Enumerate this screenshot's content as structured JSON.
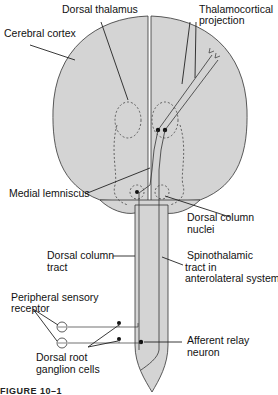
{
  "figure": {
    "caption": "FIGURE 10–1",
    "colors": {
      "tissue_fill": "#d4d4d4",
      "outline": "#333333",
      "background": "#ffffff"
    },
    "labels": {
      "dorsal_thalamus": "Dorsal thalamus",
      "thalamocortical_1": "Thalamocortical",
      "thalamocortical_2": "projection",
      "cerebral_cortex": "Cerebral cortex",
      "medial_lemniscus": "Medial lemniscus",
      "dorsal_column_nuclei_1": "Dorsal column",
      "dorsal_column_nuclei_2": "nuclei",
      "dorsal_column_tract_1": "Dorsal column",
      "dorsal_column_tract_2": "tract",
      "spinothalamic_1": "Spinothalamic",
      "spinothalamic_2": "tract in",
      "spinothalamic_3": "anterolateral system",
      "peripheral_receptor_1": "Peripheral sensory",
      "peripheral_receptor_2": "receptor",
      "afferent_relay_1": "Afferent relay",
      "afferent_relay_2": "neuron",
      "drg_1": "Dorsal root",
      "drg_2": "ganglion cells"
    }
  }
}
